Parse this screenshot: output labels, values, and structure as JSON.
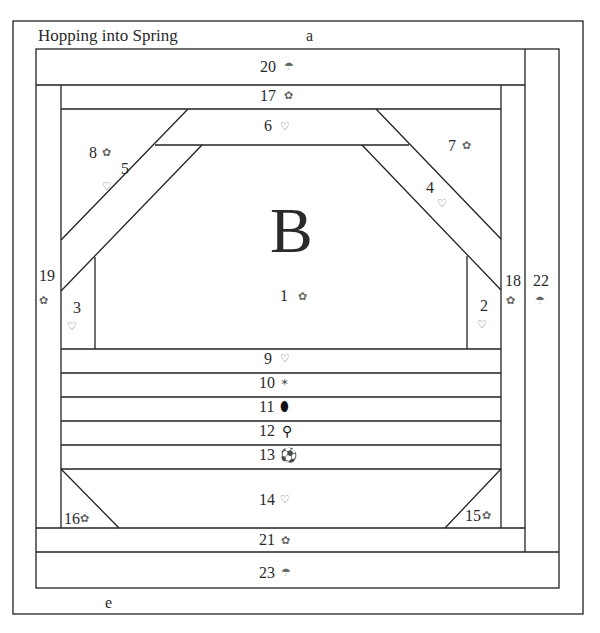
{
  "title": "Hopping into Spring",
  "block_letter": "B",
  "edge_labels": {
    "top": "a",
    "bottom": "e"
  },
  "pieces": [
    {
      "n": "1",
      "icon": "ribbon-icon",
      "glyph": "✿"
    },
    {
      "n": "2",
      "icon": "heart-arrow-icon",
      "glyph": "♡"
    },
    {
      "n": "3",
      "icon": "heart-arrow-icon",
      "glyph": "♡"
    },
    {
      "n": "4",
      "icon": "heart-arrow-icon",
      "glyph": "♡"
    },
    {
      "n": "5",
      "icon": "heart-arrow-icon",
      "glyph": "♡"
    },
    {
      "n": "6",
      "icon": "heart-arrow-icon",
      "glyph": "♡"
    },
    {
      "n": "7",
      "icon": "ribbon-icon",
      "glyph": "✿"
    },
    {
      "n": "8",
      "icon": "ribbon-icon",
      "glyph": "✿"
    },
    {
      "n": "9",
      "icon": "heart-arrow-icon",
      "glyph": "♡"
    },
    {
      "n": "10",
      "icon": "shuttlecock-icon",
      "glyph": "✶"
    },
    {
      "n": "11",
      "icon": "football-icon",
      "glyph": "⬮"
    },
    {
      "n": "12",
      "icon": "golf-tee-icon",
      "glyph": "⚲"
    },
    {
      "n": "13",
      "icon": "soccer-ball-icon",
      "glyph": "⚽"
    },
    {
      "n": "14",
      "icon": "heart-arrow-icon",
      "glyph": "♡"
    },
    {
      "n": "15",
      "icon": "ribbon-icon",
      "glyph": "✿"
    },
    {
      "n": "16",
      "icon": "ribbon-icon",
      "glyph": "✿"
    },
    {
      "n": "17",
      "icon": "ribbon-icon",
      "glyph": "✿"
    },
    {
      "n": "18",
      "icon": "ribbon-icon",
      "glyph": "✿"
    },
    {
      "n": "19",
      "icon": "ribbon-icon",
      "glyph": "✿"
    },
    {
      "n": "20",
      "icon": "umbrella-icon",
      "glyph": "☂"
    },
    {
      "n": "21",
      "icon": "ribbon-icon",
      "glyph": "✿"
    },
    {
      "n": "22",
      "icon": "umbrella-icon",
      "glyph": "☂"
    },
    {
      "n": "23",
      "icon": "umbrella-icon",
      "glyph": "☂"
    }
  ]
}
